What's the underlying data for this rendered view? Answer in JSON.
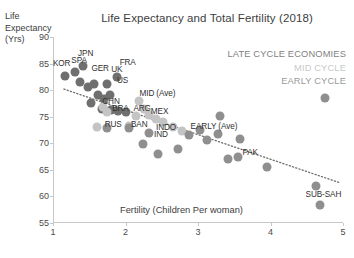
{
  "chart_data": {
    "type": "scatter",
    "title": "Life Expectancy and Total Fertility (2018)",
    "xlabel": "Fertility (Children Per woman)",
    "ylabel_lines": [
      "Life",
      "Expectancy",
      "(Yrs)"
    ],
    "xlim": [
      1,
      5
    ],
    "ylim": [
      55,
      90
    ],
    "xticks": [
      1,
      2,
      3,
      4,
      5
    ],
    "yticks": [
      55,
      60,
      65,
      70,
      75,
      80,
      85,
      90
    ],
    "grid": false,
    "legend_position": "top-right",
    "legend": [
      {
        "label": "LATE CYCLE ECONOMIES",
        "color": "#7f7f7f"
      },
      {
        "label": "MID CYCLE",
        "color": "#c9c9c9"
      },
      {
        "label": "EARLY CYCLE",
        "color": "#9a9a9a"
      }
    ],
    "trendline": {
      "x": [
        1.15,
        4.95
      ],
      "y": [
        80.2,
        62.6
      ],
      "style": "dotted",
      "color": "#6e6e6e"
    },
    "series": [
      {
        "name": "LATE CYCLE ECONOMIES",
        "color": "#6f6f6f",
        "points": [
          {
            "label": "JPN",
            "x": 1.42,
            "y": 84.5,
            "lx": 1.45,
            "ly": 86.9
          },
          {
            "label": "SPA",
            "x": 1.31,
            "y": 83.5,
            "lx": 1.36,
            "ly": 85.6
          },
          {
            "label": "KOR",
            "x": 1.17,
            "y": 82.6,
            "lx": 1.12,
            "ly": 85.1
          },
          {
            "label": "GER",
            "x": 1.57,
            "y": 81.2,
            "lx": 1.65,
            "ly": 84.2
          },
          {
            "label": "UK",
            "x": 1.75,
            "y": 81.2,
            "lx": 1.88,
            "ly": 84.0
          },
          {
            "label": "FRA",
            "x": 1.88,
            "y": 82.5,
            "lx": 2.03,
            "ly": 85.3
          },
          {
            "label": "US",
            "x": 1.78,
            "y": 79.0,
            "lx": 1.96,
            "ly": 81.9
          },
          {
            "label": "",
            "x": 1.48,
            "y": 80.6
          },
          {
            "label": "",
            "x": 1.62,
            "y": 79.1
          },
          {
            "label": "",
            "x": 1.7,
            "y": 78.3
          },
          {
            "label": "",
            "x": 1.37,
            "y": 81.6
          },
          {
            "label": "",
            "x": 1.53,
            "y": 77.6
          },
          {
            "label": "",
            "x": 1.68,
            "y": 76.5
          },
          {
            "label": "",
            "x": 1.8,
            "y": 76.2
          },
          {
            "label": "",
            "x": 1.9,
            "y": 76.0
          },
          {
            "label": "",
            "x": 2.0,
            "y": 75.8
          }
        ]
      },
      {
        "name": "MID CYCLE",
        "color": "#c4c4c4",
        "points": [
          {
            "label": "MID (Ave)",
            "x": 2.18,
            "y": 78.0,
            "lx": 2.44,
            "ly": 79.4
          },
          {
            "label": "CHN",
            "x": 1.69,
            "y": 76.9,
            "lx": 1.8,
            "ly": 77.9
          },
          {
            "label": "BRA",
            "x": 1.74,
            "y": 75.9,
            "lx": 1.93,
            "ly": 76.6
          },
          {
            "label": "ARG",
            "x": 2.26,
            "y": 76.4,
            "lx": 2.23,
            "ly": 76.6
          },
          {
            "label": "MEX",
            "x": 2.14,
            "y": 75.1,
            "lx": 2.47,
            "ly": 76.0
          },
          {
            "label": "",
            "x": 2.33,
            "y": 75.3
          },
          {
            "label": "",
            "x": 2.42,
            "y": 74.5
          },
          {
            "label": "",
            "x": 1.6,
            "y": 73.0
          },
          {
            "label": "",
            "x": 2.05,
            "y": 73.2
          },
          {
            "label": "",
            "x": 2.52,
            "y": 74.0
          },
          {
            "label": "",
            "x": 2.65,
            "y": 73.1
          },
          {
            "label": "",
            "x": 2.78,
            "y": 72.4
          }
        ]
      },
      {
        "name": "EARLY CYCLE",
        "color": "#8f8f8f",
        "points": [
          {
            "label": "EARLY (Ave)",
            "x": 3.03,
            "y": 72.5,
            "lx": 3.22,
            "ly": 73.3
          },
          {
            "label": "RUS",
            "x": 1.75,
            "y": 72.9,
            "lx": 1.83,
            "ly": 73.6
          },
          {
            "label": "BAN",
            "x": 2.05,
            "y": 72.8,
            "lx": 2.19,
            "ly": 73.7
          },
          {
            "label": "INDO",
            "x": 2.32,
            "y": 72.0,
            "lx": 2.56,
            "ly": 73.0
          },
          {
            "label": "IND",
            "x": 2.24,
            "y": 69.8,
            "lx": 2.49,
            "ly": 71.7
          },
          {
            "label": "PAK",
            "x": 3.55,
            "y": 67.5,
            "lx": 3.72,
            "ly": 68.3
          },
          {
            "label": "SUB-SAH",
            "x": 4.63,
            "y": 61.9,
            "lx": 4.73,
            "ly": 60.5
          },
          {
            "label": "",
            "x": 2.88,
            "y": 71.6
          },
          {
            "label": "",
            "x": 3.12,
            "y": 70.6
          },
          {
            "label": "",
            "x": 3.28,
            "y": 71.8
          },
          {
            "label": "",
            "x": 3.3,
            "y": 75.2
          },
          {
            "label": "",
            "x": 3.58,
            "y": 70.9
          },
          {
            "label": "",
            "x": 3.42,
            "y": 67.0
          },
          {
            "label": "",
            "x": 3.95,
            "y": 65.6
          },
          {
            "label": "",
            "x": 2.72,
            "y": 69.0
          },
          {
            "label": "",
            "x": 2.45,
            "y": 68.0
          },
          {
            "label": "",
            "x": 4.68,
            "y": 58.4
          },
          {
            "label": "",
            "x": 4.75,
            "y": 78.5
          }
        ]
      }
    ]
  }
}
